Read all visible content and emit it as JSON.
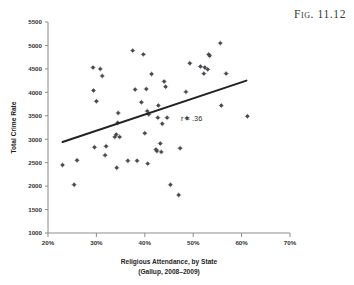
{
  "figure": {
    "label": "Fig. 11.12"
  },
  "chart_data": {
    "type": "scatter",
    "title": "",
    "xlabel_line1": "Religious Attendance, by State",
    "xlabel_line2": "(Gallup, 2008–2009)",
    "ylabel": "Total Crime Rate",
    "xlim": [
      20,
      70
    ],
    "ylim": [
      1000,
      5500
    ],
    "xticks": [
      20,
      30,
      40,
      50,
      60,
      70
    ],
    "xtick_labels": [
      "20%",
      "30%",
      "40%",
      "50%",
      "60%",
      "70%"
    ],
    "yticks": [
      1000,
      1500,
      2000,
      2500,
      3000,
      3500,
      4000,
      4500,
      5000,
      5500
    ],
    "ytick_labels": [
      "1000",
      "1500",
      "2000",
      "2500",
      "3000",
      "3500",
      "4000",
      "4500",
      "5000",
      "5500"
    ],
    "grid": false,
    "legend": "none",
    "annotation": "r = .36",
    "annotation_x": 47.5,
    "annotation_y": 3380,
    "correlation": 0.36,
    "point_color": "#4a4a52",
    "trendline_color": "#232323",
    "trendline": {
      "x_start": 23.0,
      "y_start": 2940,
      "x_end": 61.0,
      "y_end": 4250
    },
    "x": [
      23.0,
      25.4,
      26.0,
      29.3,
      29.4,
      29.6,
      30.0,
      30.8,
      31.2,
      31.8,
      32.0,
      33.8,
      34.1,
      34.2,
      34.4,
      34.5,
      34.8,
      36.5,
      37.5,
      38.0,
      38.4,
      39.3,
      39.7,
      40.0,
      40.3,
      40.5,
      40.6,
      40.8,
      41.4,
      42.3,
      42.5,
      42.7,
      42.8,
      43.2,
      43.4,
      43.6,
      44.0,
      44.3,
      44.6,
      45.3,
      47.0,
      47.3,
      48.5,
      48.7,
      49.3,
      51.5,
      52.2,
      52.4,
      53.0,
      53.2,
      53.4,
      55.6,
      55.8,
      56.8,
      61.2
    ],
    "y": [
      2450,
      2030,
      2550,
      4530,
      4040,
      2830,
      3810,
      4500,
      4350,
      2660,
      2850,
      3050,
      3100,
      2390,
      3350,
      3560,
      3050,
      2540,
      4890,
      4060,
      2540,
      3790,
      4810,
      3130,
      4070,
      3600,
      2480,
      3530,
      4390,
      2780,
      2750,
      3460,
      3720,
      2910,
      2730,
      3330,
      4230,
      4120,
      3460,
      2030,
      1810,
      2810,
      4010,
      3450,
      4620,
      4550,
      4400,
      4530,
      4490,
      4810,
      4780,
      5050,
      3720,
      4400,
      3490
    ],
    "n_points": 55
  }
}
